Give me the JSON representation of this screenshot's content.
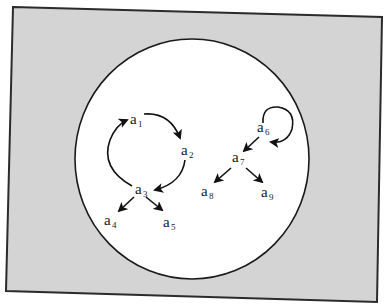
{
  "diagram": {
    "type": "directed-graph",
    "background_color": "#d4d4d4",
    "frame_border_color": "#2b2b2b",
    "universe_color": "#ffffff",
    "universe_border_color": "#1a1a1a",
    "edge_color": "#111111",
    "frame_corners": [
      [
        13,
        7
      ],
      [
        382,
        17
      ],
      [
        377,
        302
      ],
      [
        6,
        291
      ]
    ],
    "universe": {
      "cx": 192,
      "cy": 159,
      "rx": 117,
      "ry": 120
    },
    "nodes": [
      {
        "id": "a1",
        "base": "a",
        "sub": "1",
        "x": 130,
        "y": 124
      },
      {
        "id": "a2",
        "base": "a",
        "sub": "2",
        "x": 181,
        "y": 155
      },
      {
        "id": "a3",
        "base": "a",
        "sub": "3",
        "x": 135,
        "y": 194
      },
      {
        "id": "a4",
        "base": "a",
        "sub": "4",
        "x": 104,
        "y": 225
      },
      {
        "id": "a5",
        "base": "a",
        "sub": "5",
        "x": 163,
        "y": 227
      },
      {
        "id": "a6",
        "base": "a",
        "sub": "6",
        "x": 257,
        "y": 132
      },
      {
        "id": "a7",
        "base": "a",
        "sub": "7",
        "x": 232,
        "y": 162
      },
      {
        "id": "a8",
        "base": "a",
        "sub": "8",
        "x": 201,
        "y": 196
      },
      {
        "id": "a9",
        "base": "a",
        "sub": "9",
        "x": 261,
        "y": 197
      }
    ],
    "edges": [
      {
        "from": "a1",
        "to": "a2",
        "shape": "arc"
      },
      {
        "from": "a2",
        "to": "a3",
        "shape": "arc"
      },
      {
        "from": "a3",
        "to": "a1",
        "shape": "arc"
      },
      {
        "from": "a3",
        "to": "a4",
        "shape": "straight"
      },
      {
        "from": "a3",
        "to": "a5",
        "shape": "straight"
      },
      {
        "from": "a6",
        "to": "a6",
        "shape": "self-loop"
      },
      {
        "from": "a6",
        "to": "a7",
        "shape": "straight"
      },
      {
        "from": "a7",
        "to": "a8",
        "shape": "straight"
      },
      {
        "from": "a7",
        "to": "a9",
        "shape": "straight"
      }
    ]
  }
}
